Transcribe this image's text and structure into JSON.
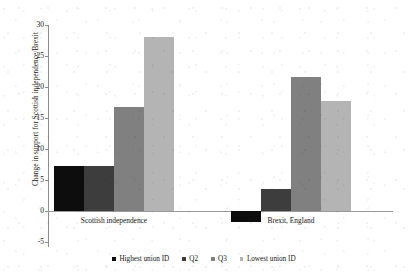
{
  "chart_data": {
    "type": "bar",
    "title": "",
    "xlabel": "",
    "ylabel": "Change in support for Scottish independence/Brexit",
    "categories": [
      "Scottish independence",
      "Brexit, England"
    ],
    "series": [
      {
        "name": "Highest union ID",
        "color": "#0d0d0d",
        "values": [
          7.3,
          -1.8
        ]
      },
      {
        "name": "Q2",
        "color": "#3d3d3d",
        "values": [
          7.2,
          3.5
        ]
      },
      {
        "name": "Q3",
        "color": "#808080",
        "values": [
          16.8,
          21.6
        ]
      },
      {
        "name": "Lowest union ID",
        "color": "#b4b4b4",
        "values": [
          28.0,
          17.7
        ]
      }
    ],
    "ylim": [
      -5,
      30
    ],
    "yticks": [
      -5,
      0,
      5,
      10,
      15,
      20,
      25,
      30
    ],
    "ytick_labels": [
      "-5",
      "0",
      "5",
      "10",
      "15",
      "20",
      "25",
      "30"
    ],
    "grid": false,
    "legend_position": "bottom",
    "zero_line": true
  },
  "legend": {
    "items": [
      {
        "label": "Highest union ID",
        "color": "#0d0d0d"
      },
      {
        "label": "Q2",
        "color": "#3d3d3d"
      },
      {
        "label": "Q3",
        "color": "#808080"
      },
      {
        "label": "Lowest union ID",
        "color": "#b4b4b4"
      }
    ]
  }
}
